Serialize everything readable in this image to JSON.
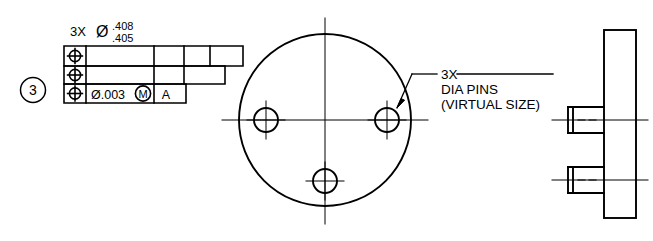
{
  "drawing": {
    "title": "GD&T Position Tolerance Drawing - Three Pin Gage",
    "balloon": {
      "number": "3",
      "name": "detail-balloon"
    },
    "hole_callout": {
      "quantity": "3X",
      "diameter_symbol": "Ø",
      "limit_upper": ".408",
      "limit_lower": ".405"
    },
    "feature_control_frame": {
      "rows": [
        {
          "symbol": "⊕",
          "tolerance": "",
          "modifier": "",
          "datum_primary": "",
          "datum_secondary": "",
          "datum_tertiary": ""
        },
        {
          "symbol": "⊕",
          "tolerance": "",
          "modifier": "",
          "datum_primary": "",
          "datum_secondary": "",
          "datum_tertiary": ""
        },
        {
          "symbol": "⊕",
          "tolerance": "Ø.003",
          "modifier": "M",
          "datum_primary": "A",
          "datum_secondary": "",
          "datum_tertiary": ""
        }
      ]
    },
    "pin_note": {
      "line1": "3X",
      "line2": "DIA PINS",
      "line3": "(VIRTUAL SIZE)"
    },
    "front_view": {
      "name": "front-view-circular-plate",
      "outer_circle": {
        "cx": 325,
        "cy": 120,
        "r": 86
      },
      "holes": [
        {
          "name": "hole-left",
          "cx": 266,
          "cy": 120,
          "r": 12
        },
        {
          "name": "hole-right",
          "cx": 387,
          "cy": 120,
          "r": 12
        },
        {
          "name": "hole-bottom",
          "cx": 325,
          "cy": 181,
          "r": 12
        }
      ]
    },
    "side_view": {
      "name": "side-view-plate-with-pins",
      "plate": {
        "x": 604,
        "y": 30,
        "w": 32,
        "h": 188
      },
      "pins": [
        {
          "name": "pin-upper",
          "x": 568,
          "y": 107,
          "w": 36,
          "h": 26
        },
        {
          "name": "pin-lower",
          "x": 568,
          "y": 167,
          "w": 36,
          "h": 26
        }
      ]
    },
    "colors": {
      "line": "#000000",
      "background": "#ffffff"
    }
  }
}
